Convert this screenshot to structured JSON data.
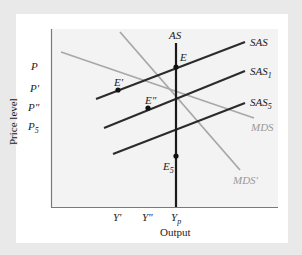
{
  "diagram": {
    "title": "",
    "axes": {
      "x_label": "Output",
      "y_label": "Price level"
    },
    "y_ticks": [
      {
        "id": "p",
        "label": "P"
      },
      {
        "id": "p_prime",
        "label": "P'"
      },
      {
        "id": "p_double_prime",
        "label": "P\""
      },
      {
        "id": "p5",
        "label": "P5",
        "base": "P",
        "sub": "5"
      }
    ],
    "x_ticks": [
      {
        "id": "y_prime",
        "label": "Y'"
      },
      {
        "id": "y_double_prime",
        "label": "Y\""
      },
      {
        "id": "yp",
        "label": "Yp",
        "base": "Y",
        "sub": "p"
      }
    ],
    "curves": [
      {
        "id": "as",
        "label": "AS",
        "color": "#1a1a1a",
        "type": "vertical"
      },
      {
        "id": "sas",
        "label": "SAS",
        "color": "#2b2b2b"
      },
      {
        "id": "sas1",
        "label": "SAS1",
        "base": "SAS",
        "sub": "1",
        "color": "#2b2b2b"
      },
      {
        "id": "sas5",
        "label": "SAS5",
        "base": "SAS",
        "sub": "5",
        "color": "#2b2b2b"
      },
      {
        "id": "mds",
        "label": "MDS",
        "color": "#a8a8a8"
      },
      {
        "id": "mds_prime",
        "label": "MDS'",
        "color": "#a8a8a8"
      }
    ],
    "points": [
      {
        "id": "e",
        "label": "E"
      },
      {
        "id": "e_prime",
        "label": "E'"
      },
      {
        "id": "e_double_prime",
        "label": "E\""
      },
      {
        "id": "e5",
        "label": "E5",
        "base": "E",
        "sub": "5"
      }
    ],
    "colors": {
      "background": "#e9e9e9",
      "panel": "#ffffff",
      "plot_area": "#f3f3f3",
      "dark_line": "#2b2b2b",
      "gray_line": "#a8a8a8"
    }
  }
}
